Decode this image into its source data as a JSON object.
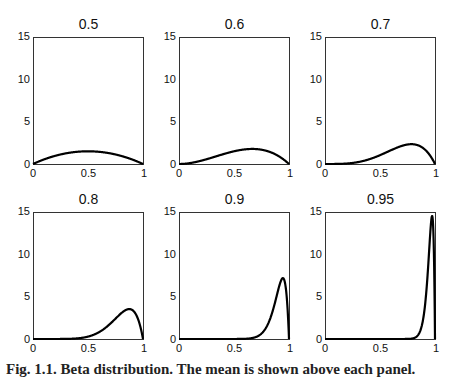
{
  "figure": {
    "caption": "Fig. 1.1. Beta distribution. The mean is shown above each panel."
  },
  "axes": {
    "yticks": [
      "0",
      "5",
      "10",
      "15"
    ],
    "xticks": [
      "0",
      "0.5",
      "1"
    ],
    "ylim": [
      0,
      15
    ],
    "xlim": [
      0,
      1
    ]
  },
  "panels": [
    {
      "title": "0.5",
      "a": 2,
      "b": 2
    },
    {
      "title": "0.6",
      "a": 3,
      "b": 2
    },
    {
      "title": "0.7",
      "a": 4.6667,
      "b": 2
    },
    {
      "title": "0.8",
      "a": 8,
      "b": 2
    },
    {
      "title": "0.9",
      "a": 18,
      "b": 2
    },
    {
      "title": "0.95",
      "a": 38,
      "b": 2
    }
  ],
  "chart_data": [
    {
      "type": "line",
      "title": "0.5",
      "xlabel": "",
      "ylabel": "",
      "xlim": [
        0,
        1
      ],
      "ylim": [
        0,
        15
      ],
      "grid": false,
      "x": [
        0,
        0.1,
        0.2,
        0.3,
        0.4,
        0.5,
        0.6,
        0.7,
        0.8,
        0.9,
        1
      ],
      "y": [
        0,
        0.54,
        0.96,
        1.26,
        1.44,
        1.5,
        1.44,
        1.26,
        0.96,
        0.54,
        0
      ]
    },
    {
      "type": "line",
      "title": "0.6",
      "xlabel": "",
      "ylabel": "",
      "xlim": [
        0,
        1
      ],
      "ylim": [
        0,
        15
      ],
      "grid": false,
      "x": [
        0,
        0.1,
        0.2,
        0.3,
        0.4,
        0.5,
        0.6,
        0.7,
        0.8,
        0.9,
        1
      ],
      "y": [
        0,
        0.11,
        0.38,
        0.76,
        1.15,
        1.5,
        1.73,
        1.76,
        1.54,
        0.97,
        0
      ]
    },
    {
      "type": "line",
      "title": "0.7",
      "xlabel": "",
      "ylabel": "",
      "xlim": [
        0,
        1
      ],
      "ylim": [
        0,
        15
      ],
      "grid": false,
      "x": [
        0,
        0.1,
        0.2,
        0.3,
        0.4,
        0.5,
        0.6,
        0.7,
        0.8,
        0.9,
        1
      ],
      "y": [
        0,
        0.01,
        0.07,
        0.28,
        0.64,
        1.1,
        1.57,
        1.94,
        2.07,
        1.53,
        0
      ]
    },
    {
      "type": "line",
      "title": "0.8",
      "xlabel": "",
      "ylabel": "",
      "xlim": [
        0,
        1
      ],
      "ylim": [
        0,
        15
      ],
      "grid": false,
      "x": [
        0,
        0.2,
        0.4,
        0.5,
        0.6,
        0.7,
        0.8,
        0.875,
        0.9,
        0.95,
        1
      ],
      "y": [
        0,
        0.0,
        0.01,
        0.14,
        0.4,
        0.95,
        1.89,
        3.5,
        3.1,
        2.3,
        0
      ]
    },
    {
      "type": "line",
      "title": "0.9",
      "xlabel": "",
      "ylabel": "",
      "xlim": [
        0,
        1
      ],
      "ylim": [
        0,
        15
      ],
      "grid": false,
      "x": [
        0,
        0.5,
        0.7,
        0.8,
        0.85,
        0.9,
        0.944,
        0.97,
        1
      ],
      "y": [
        0,
        0.0,
        0.05,
        1.3,
        2.9,
        5.4,
        7.1,
        5.2,
        0
      ]
    },
    {
      "type": "line",
      "title": "0.95",
      "xlabel": "",
      "ylabel": "",
      "xlim": [
        0,
        1
      ],
      "ylim": [
        0,
        15
      ],
      "grid": false,
      "x": [
        0,
        0.5,
        0.8,
        0.85,
        0.9,
        0.95,
        0.974,
        0.99,
        1
      ],
      "y": [
        0,
        0.0,
        0.05,
        0.35,
        2.5,
        9.8,
        14.4,
        10.1,
        0
      ]
    }
  ]
}
